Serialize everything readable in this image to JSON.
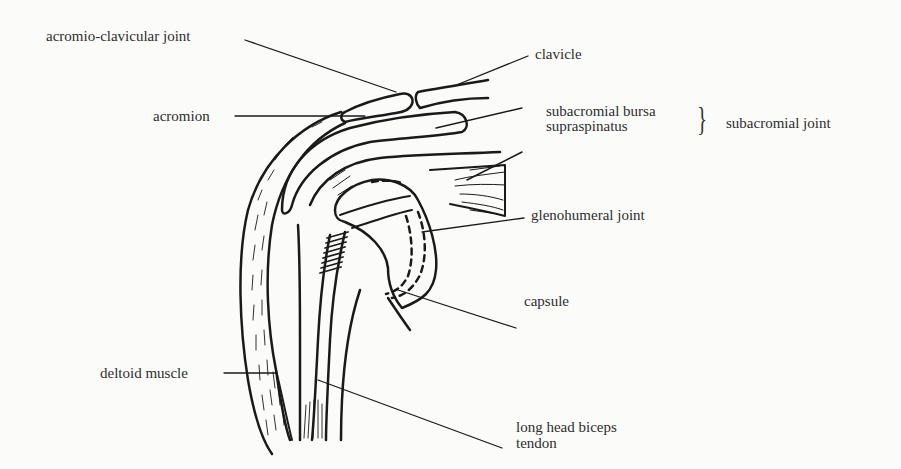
{
  "diagram": {
    "labels": {
      "acromio_clavicular_joint": "acromio-clavicular joint",
      "clavicle": "clavicle",
      "acromion": "acromion",
      "subacromial_bursa": "subacromial bursa",
      "supraspinatus": "supraspinatus",
      "subacromial_joint": "subacromial joint",
      "glenohumeral_joint": "glenohumeral joint",
      "capsule": "capsule",
      "deltoid_muscle": "deltoid muscle",
      "long_head_biceps_line1": "long head biceps",
      "long_head_biceps_line2": "tendon"
    },
    "grouping": {
      "brace_symbol": "}",
      "groups": [
        "subacromial bursa",
        "supraspinatus"
      ],
      "group_label": "subacromial joint"
    },
    "colors": {
      "background": "#fbfbfa",
      "ink": "#1a1a1a"
    }
  }
}
